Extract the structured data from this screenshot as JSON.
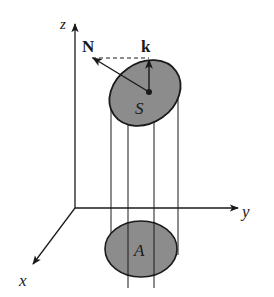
{
  "diagram": {
    "title": "",
    "axes": {
      "z_label": "z",
      "y_label": "y",
      "x_label": "x"
    },
    "vectors": {
      "normal_label": "N",
      "k_label": "k"
    },
    "regions": {
      "surface_label": "S",
      "projection_label": "A"
    },
    "colors": {
      "line": "#1a1a1a",
      "fill": "#8c8c8c",
      "background": "#ffffff"
    }
  }
}
